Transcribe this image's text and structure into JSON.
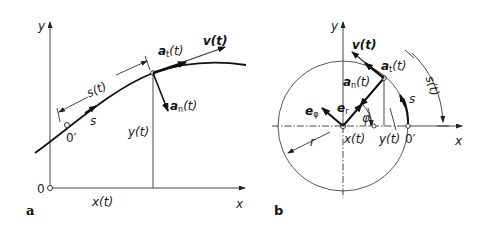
{
  "panel_a": {
    "label": "a",
    "axis_x": "x",
    "axis_y": "y",
    "origin": "0",
    "origin_prime": "0′",
    "arc_length": "s(t)",
    "path_coord": "s",
    "x_coord": "x(t)",
    "y_coord": "y(t)",
    "velocity": "v(t)",
    "tangential_accel": "a",
    "tangential_sub": "t",
    "tangential_suffix": "(t)",
    "normal_accel": "a",
    "normal_sub": "n",
    "normal_suffix": "(t)"
  },
  "panel_b": {
    "label": "b",
    "axis_x": "x",
    "axis_y": "y",
    "origin_prime": "0′",
    "arc_length": "s(t)",
    "path_coord": "s",
    "x_coord": "x(t)",
    "y_coord": "y(t)",
    "radius": "r",
    "angle": "φ",
    "velocity": "v(t)",
    "tangential_accel": "a",
    "tangential_sub": "t",
    "tangential_suffix": "(t)",
    "normal_accel": "a",
    "normal_sub": "n",
    "normal_suffix": "(t)",
    "unit_radial": "e",
    "unit_radial_sub": "r",
    "unit_angular": "e",
    "unit_angular_sub": "φ"
  }
}
